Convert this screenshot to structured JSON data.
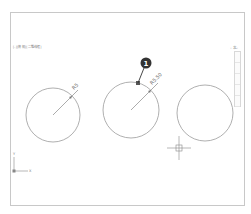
{
  "viewport": {
    "label": "[-][俯视][二维线框]",
    "compass_label": "- 北 -",
    "navbar_segments": 5
  },
  "drawing": {
    "circles": [
      {
        "name": "left-circle",
        "cx": 53,
        "cy": 115,
        "r": 27,
        "dimension": "R5"
      },
      {
        "name": "middle-circle",
        "cx": 131,
        "cy": 110,
        "r": 28,
        "dimension": "R5.50"
      },
      {
        "name": "right-circle",
        "cx": 205,
        "cy": 113,
        "r": 28
      }
    ],
    "callout": {
      "number": "1",
      "x": 146,
      "y": 63
    },
    "ucs": {
      "x_label": "X",
      "y_label": "Y"
    },
    "colors": {
      "geometry": "#999999",
      "dimension": "#777777",
      "callout": "#333333"
    }
  }
}
